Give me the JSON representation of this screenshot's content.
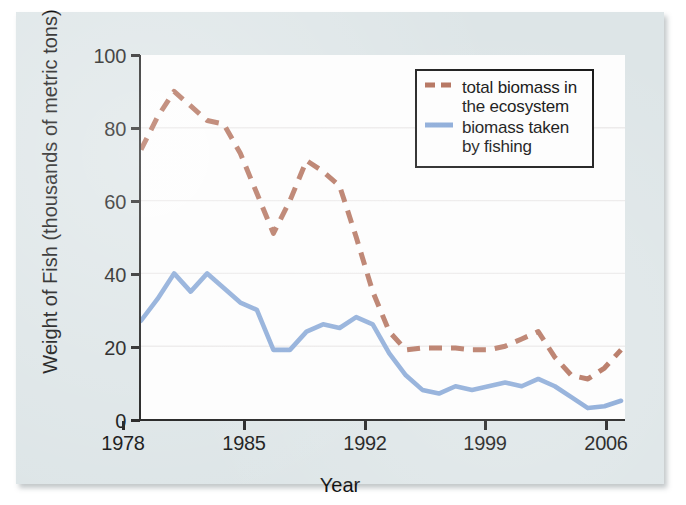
{
  "chart_data": {
    "type": "line",
    "title": "",
    "xlabel": "Year",
    "ylabel": "Weight of Fish (thousands of metric tons)",
    "xlim": [
      1978,
      2007
    ],
    "ylim": [
      0,
      100
    ],
    "xticks": [
      "1978",
      "1985",
      "1992",
      "1999",
      "2006"
    ],
    "xtick_values": [
      1978,
      1985,
      1992,
      1999,
      2006
    ],
    "yticks": [
      "0",
      "20",
      "40",
      "60",
      "80",
      "100"
    ],
    "ytick_values": [
      0,
      20,
      40,
      60,
      80,
      100
    ],
    "grid": "horizontal",
    "legend_position": "top-right",
    "x": [
      1978,
      1979,
      1980,
      1981,
      1982,
      1983,
      1984,
      1985,
      1986,
      1987,
      1988,
      1989,
      1990,
      1991,
      1992,
      1993,
      1994,
      1995,
      1996,
      1997,
      1998,
      1999,
      2000,
      2001,
      2002,
      2003,
      2004,
      2005,
      2006,
      2007
    ],
    "series": [
      {
        "name": "total biomass in the ecosystem",
        "style": "dashed",
        "color": "#b06b55",
        "values": [
          74,
          83,
          90,
          86,
          82,
          81,
          73,
          62,
          51,
          60,
          71,
          68,
          64,
          50,
          35,
          24,
          19,
          19.5,
          19.5,
          19.5,
          19,
          19,
          20,
          22,
          24,
          17,
          12,
          11,
          14,
          19
        ]
      },
      {
        "name": "biomass taken by fishing",
        "style": "solid",
        "color": "#85a6d6",
        "values": [
          27,
          33,
          40,
          35,
          40,
          36,
          32,
          30,
          19,
          19,
          24,
          26,
          25,
          28,
          26,
          18,
          12,
          8,
          7,
          9,
          8,
          9,
          10,
          9,
          11,
          9,
          6,
          3,
          3.5,
          5
        ]
      }
    ]
  },
  "legend": {
    "entries": [
      {
        "label_line1": "total biomass in",
        "label_line2": "the ecosystem",
        "swatch": "dashed-brown-line-swatch"
      },
      {
        "label_line1": "biomass taken",
        "label_line2": "by fishing",
        "swatch": "solid-blue-line-swatch"
      }
    ]
  },
  "axes": {
    "x_title": "Year",
    "y_title": "Weight of Fish (thousands of metric tons)"
  },
  "colors": {
    "brown_series": "#b06b55",
    "blue_series": "#85a6d6",
    "card_background": "#dde5e7",
    "plot_background": "#fdfdfd",
    "axis": "#1a1a1a",
    "gridline": "#eceaea"
  }
}
